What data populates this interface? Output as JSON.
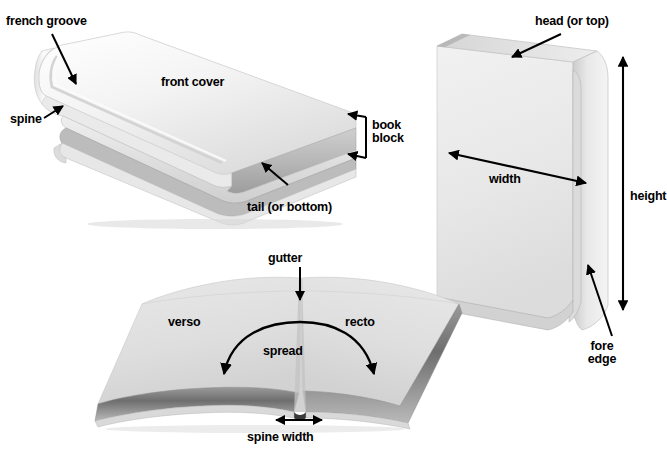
{
  "figure": {
    "background_color": "#ffffff",
    "text_color": "#000000"
  },
  "panels": [
    {
      "id": "closed-book",
      "name": "Closed hardcover book, three-quarter view",
      "labels": [
        {
          "id": "french-groove",
          "text": "french groove"
        },
        {
          "id": "spine",
          "text": "spine"
        },
        {
          "id": "front-cover",
          "text": "front cover"
        },
        {
          "id": "book-block",
          "text": "book\nblock",
          "line1": "book",
          "line2": "block"
        },
        {
          "id": "tail",
          "text": "tail (or bottom)"
        }
      ]
    },
    {
      "id": "standing-book",
      "name": "Standing book, front cover facing left",
      "labels": [
        {
          "id": "head",
          "text": "head (or top)"
        },
        {
          "id": "width",
          "text": "width"
        },
        {
          "id": "height",
          "text": "height"
        },
        {
          "id": "fore-edge",
          "text": "fore\nedge",
          "line1": "fore",
          "line2": "edge"
        }
      ]
    },
    {
      "id": "open-book",
      "name": "Open book showing a two-page spread",
      "labels": [
        {
          "id": "gutter",
          "text": "gutter"
        },
        {
          "id": "verso",
          "text": "verso"
        },
        {
          "id": "recto",
          "text": "recto"
        },
        {
          "id": "spread",
          "text": "spread"
        },
        {
          "id": "spine-width",
          "text": "spine width"
        }
      ]
    }
  ],
  "labels": {
    "french_groove": "french groove",
    "spine": "spine",
    "front_cover": "front cover",
    "book_block_line1": "book",
    "book_block_line2": "block",
    "tail": "tail (or bottom)",
    "head": "head (or top)",
    "width": "width",
    "height": "height",
    "fore_edge_line1": "fore",
    "fore_edge_line2": "edge",
    "gutter": "gutter",
    "verso": "verso",
    "recto": "recto",
    "spread": "spread",
    "spine_width": "spine width"
  },
  "colors": {
    "cover_light": "#f2f2f2",
    "cover_white": "#fbfbfb",
    "cover_shade": "#d8d8d8",
    "cover_dark": "#b8b8b8",
    "page_edge": "#cfcfcf",
    "page_shadow": "#8f8f8f",
    "deep_shadow": "#5a5a5a",
    "ink": "#000000",
    "paper": "#e3e3e3"
  }
}
